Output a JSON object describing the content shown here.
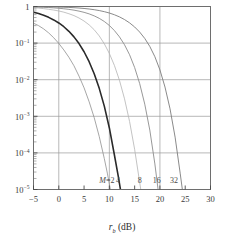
{
  "chart_data": {
    "type": "line",
    "title": "",
    "xlabel": "r_b (dB)",
    "xlabel_parts": {
      "var": "r",
      "sub": "b",
      "unit": "(dB)"
    },
    "ylabel": "",
    "scale": {
      "x": "linear",
      "y": "log"
    },
    "xlim": [
      -5,
      30
    ],
    "ylim": [
      1e-05,
      1
    ],
    "xticks": [
      -5,
      0,
      5,
      10,
      15,
      20,
      25,
      30
    ],
    "xtick_labels": [
      "−5",
      "0",
      "5",
      "10",
      "15",
      "20",
      "25",
      "30"
    ],
    "yticks": [
      1,
      0.1,
      0.01,
      0.001,
      0.0001,
      1e-05
    ],
    "ytick_labels": [
      "1",
      "10-1",
      "10-2",
      "10-3",
      "10-4",
      "10-5"
    ],
    "ytick_mantissa": [
      "1",
      "10",
      "10",
      "10",
      "10",
      "10"
    ],
    "ytick_exponent": [
      "",
      "−1",
      "−2",
      "−3",
      "−4",
      "−5"
    ],
    "grid": {
      "x": true,
      "y": true,
      "x_major": [
        0,
        10,
        20,
        30
      ],
      "y_major": [
        0.1,
        0.01,
        0.001,
        0.0001,
        1e-05
      ],
      "color": "#9a9a9a"
    },
    "minor_ticks_y": true,
    "legend_position": "inline-curve-labels",
    "series": [
      {
        "name": "M=2",
        "label": "M=2",
        "label_italic_prefix": "M",
        "label_rest": "=2",
        "color": "#8f8f8f",
        "width": 0.8,
        "label_x": 8.0,
        "points": [
          [
            -5,
            0.35
          ],
          [
            -4,
            0.3
          ],
          [
            -3,
            0.245
          ],
          [
            -2,
            0.19
          ],
          [
            -1,
            0.14
          ],
          [
            0,
            0.098
          ],
          [
            1,
            0.065
          ],
          [
            2,
            0.041
          ],
          [
            3,
            0.024
          ],
          [
            4,
            0.0125
          ],
          [
            5,
            0.006
          ],
          [
            6,
            0.0025
          ],
          [
            7,
            0.00092
          ],
          [
            8,
            0.00028
          ],
          [
            9,
            7e-05
          ],
          [
            9.6,
            2.8e-05
          ],
          [
            10.2,
            1e-05
          ],
          [
            10.6,
            4.5e-06
          ]
        ]
      },
      {
        "name": "M=4",
        "label": "4",
        "color": "#2a2a2a",
        "width": 1.6,
        "label_x": 11.3,
        "points": [
          [
            -5,
            0.7
          ],
          [
            -4,
            0.64
          ],
          [
            -3,
            0.575
          ],
          [
            -2,
            0.505
          ],
          [
            -1,
            0.43
          ],
          [
            0,
            0.355
          ],
          [
            1,
            0.28
          ],
          [
            2,
            0.21
          ],
          [
            3,
            0.148
          ],
          [
            4,
            0.097
          ],
          [
            5,
            0.058
          ],
          [
            6,
            0.031
          ],
          [
            7,
            0.0145
          ],
          [
            8,
            0.0058
          ],
          [
            9,
            0.0019
          ],
          [
            10,
            0.00048
          ],
          [
            11,
            8.75e-05
          ],
          [
            11.8,
            2.15e-05
          ],
          [
            12.5,
            5.5e-06
          ],
          [
            12.9,
            2.4e-06
          ]
        ]
      },
      {
        "name": "M=8",
        "label": "8",
        "color": "#b4b4b4",
        "width": 0.8,
        "label_x": 15.6,
        "points": [
          [
            -5,
            0.93
          ],
          [
            -4,
            0.905
          ],
          [
            -3,
            0.875
          ],
          [
            -2,
            0.84
          ],
          [
            -1,
            0.8
          ],
          [
            0,
            0.755
          ],
          [
            1,
            0.7
          ],
          [
            2,
            0.635
          ],
          [
            3,
            0.565
          ],
          [
            4,
            0.485
          ],
          [
            5,
            0.4
          ],
          [
            6,
            0.315
          ],
          [
            7,
            0.232
          ],
          [
            8,
            0.157
          ],
          [
            9,
            0.096
          ],
          [
            10,
            0.052
          ],
          [
            11,
            0.0245
          ],
          [
            12,
            0.0096
          ],
          [
            13,
            0.003
          ],
          [
            14,
            0.00072
          ],
          [
            15,
            0.000125
          ],
          [
            16,
            1.55e-05
          ],
          [
            16.6,
            4.5e-06
          ],
          [
            17.0,
            1.8e-06
          ]
        ]
      },
      {
        "name": "M=16",
        "label": "16",
        "color": "#8c8c8c",
        "width": 0.9,
        "label_x": 18.6,
        "points": [
          [
            -5,
            0.975
          ],
          [
            -4,
            0.965
          ],
          [
            -3,
            0.952
          ],
          [
            -2,
            0.937
          ],
          [
            -1,
            0.918
          ],
          [
            0,
            0.896
          ],
          [
            1,
            0.868
          ],
          [
            2,
            0.835
          ],
          [
            3,
            0.795
          ],
          [
            4,
            0.748
          ],
          [
            5,
            0.693
          ],
          [
            6,
            0.628
          ],
          [
            7,
            0.555
          ],
          [
            8,
            0.475
          ],
          [
            9,
            0.39
          ],
          [
            10,
            0.303
          ],
          [
            11,
            0.22
          ],
          [
            12,
            0.148
          ],
          [
            13,
            0.09
          ],
          [
            14,
            0.048
          ],
          [
            15,
            0.0215
          ],
          [
            16,
            0.0078
          ],
          [
            17,
            0.00215
          ],
          [
            18,
            0.00042
          ],
          [
            19,
            5e-05
          ],
          [
            19.7,
            8.5e-06
          ],
          [
            20.2,
            2.3e-06
          ]
        ]
      },
      {
        "name": "M=32",
        "label": "32",
        "color": "#7d7d7d",
        "width": 0.9,
        "label_x": 22.0,
        "points": [
          [
            -5,
            0.992
          ],
          [
            -4,
            0.989
          ],
          [
            -3,
            0.985
          ],
          [
            -2,
            0.98
          ],
          [
            -1,
            0.974
          ],
          [
            0,
            0.966
          ],
          [
            1,
            0.956
          ],
          [
            2,
            0.944
          ],
          [
            3,
            0.928
          ],
          [
            4,
            0.908
          ],
          [
            5,
            0.884
          ],
          [
            6,
            0.854
          ],
          [
            7,
            0.818
          ],
          [
            8,
            0.775
          ],
          [
            9,
            0.723
          ],
          [
            10,
            0.663
          ],
          [
            11,
            0.595
          ],
          [
            12,
            0.52
          ],
          [
            13,
            0.44
          ],
          [
            14,
            0.357
          ],
          [
            15,
            0.276
          ],
          [
            16,
            0.2
          ],
          [
            17,
            0.134
          ],
          [
            18,
            0.081
          ],
          [
            19,
            0.0425
          ],
          [
            20,
            0.0185
          ],
          [
            21,
            0.0063
          ],
          [
            22,
            0.0016
          ],
          [
            23,
            0.00027
          ],
          [
            24,
            2.8e-05
          ],
          [
            24.8,
            4.2e-06
          ],
          [
            25.3,
            1.3e-06
          ]
        ]
      }
    ],
    "curve_labels_y": 1.55e-05
  },
  "frame": {
    "border_color": "#6e6e6e",
    "background": "#ffffff"
  }
}
